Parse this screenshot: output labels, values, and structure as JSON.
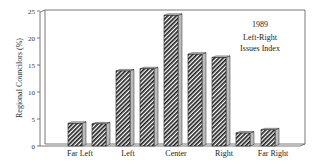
{
  "chart_data": {
    "type": "bar",
    "title": "1989",
    "subtitle": "Left-Right Issues Index",
    "xlabel": "",
    "ylabel": "Regional Councilors (%)",
    "ylim": [
      0,
      25
    ],
    "yticks": [
      0,
      5,
      10,
      15,
      20,
      25
    ],
    "grid": false,
    "legend": null,
    "x_tick_labels": [
      "Far Left",
      "Left",
      "Center",
      "Right",
      "Far Right"
    ],
    "categories": [
      "1",
      "2",
      "3",
      "4",
      "5",
      "6",
      "7",
      "8",
      "9",
      "10"
    ],
    "values": [
      4.2,
      4.1,
      13.9,
      14.3,
      24.2,
      17.0,
      16.4,
      2.4,
      3.0,
      0
    ],
    "annotations": [
      "1989",
      "Left-Right",
      "Issues Index"
    ]
  }
}
